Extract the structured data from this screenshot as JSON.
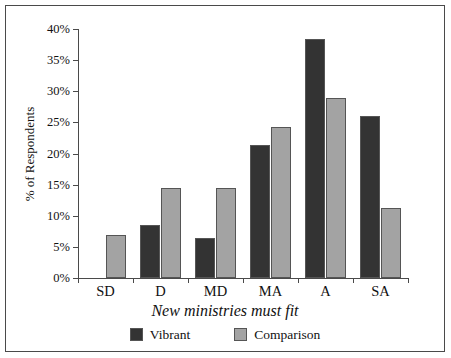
{
  "chart_data": {
    "type": "bar",
    "title": "",
    "xlabel": "New ministries must fit",
    "ylabel": "% of Respondents",
    "categories": [
      "SD",
      "D",
      "MD",
      "MA",
      "A",
      "SA"
    ],
    "series": [
      {
        "name": "Vibrant",
        "color": "#333333",
        "values": [
          0,
          8.5,
          6.4,
          21.3,
          38.4,
          26.1
        ]
      },
      {
        "name": "Comparison",
        "color": "#a3a3a3",
        "values": [
          6.9,
          14.4,
          14.4,
          24.2,
          28.9,
          11.3
        ]
      }
    ],
    "ylim": [
      0,
      40
    ],
    "ytick_values": [
      0,
      5,
      10,
      15,
      20,
      25,
      30,
      35,
      40
    ],
    "ytick_labels": [
      "0%",
      "5%",
      "10%",
      "15%",
      "20%",
      "25%",
      "30%",
      "35%",
      "40%"
    ],
    "grid": false,
    "legend_position": "bottom"
  }
}
